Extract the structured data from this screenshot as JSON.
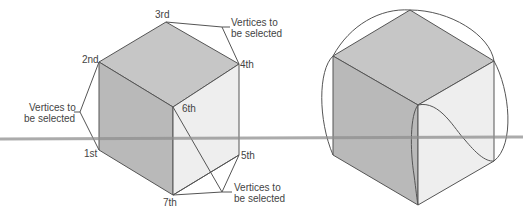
{
  "left_figure": {
    "vertices": {
      "v1": "1st",
      "v2": "2nd",
      "v3": "3rd",
      "v4": "4th",
      "v5": "5th",
      "v6": "6th",
      "v7": "7th"
    },
    "callouts": {
      "top_right": [
        "Vertices to",
        "be selected"
      ],
      "left": [
        "Vertices to",
        "be selected"
      ],
      "bottom_right": [
        "Vertices to",
        "be selected"
      ]
    }
  },
  "right_figure": {
    "description": "Cube with curved edge loops"
  },
  "colors": {
    "top_face": "#c4c4c4",
    "left_face": "#b8b8b8",
    "right_face": "#ececec",
    "edge": "#555555",
    "horizon": "#9a9a9a"
  }
}
